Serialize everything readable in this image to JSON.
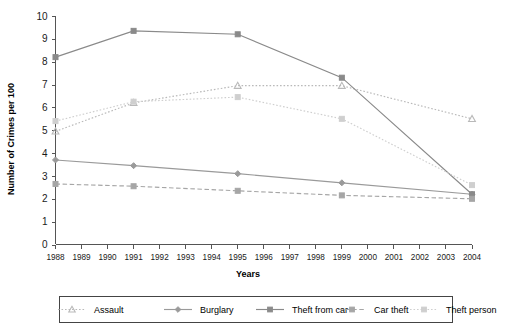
{
  "chart_data": {
    "type": "line",
    "title": "",
    "subtitle": "",
    "xlabel": "Years",
    "ylabel": "Number of Crimes per 100",
    "x": [
      1988,
      1991,
      1995,
      1999,
      2004
    ],
    "xlim": [
      1988,
      2004
    ],
    "ylim": [
      0,
      10
    ],
    "yticks": [
      0,
      1,
      2,
      3,
      4,
      5,
      6,
      7,
      8,
      9,
      10
    ],
    "ytick_labels": [
      "0",
      "1",
      "2",
      "3",
      "4",
      "5",
      "6",
      "7",
      "8",
      "9",
      "10"
    ],
    "xticks": [
      1988,
      1989,
      1990,
      1991,
      1992,
      1993,
      1994,
      1995,
      1996,
      1997,
      1998,
      1999,
      2000,
      2001,
      2002,
      2003,
      2004
    ],
    "xtick_labels": [
      "1988",
      "1989",
      "1990",
      "1991",
      "1992",
      "1993",
      "1994",
      "1995",
      "1996",
      "1997",
      "1998",
      "1999",
      "2000",
      "2001",
      "2002",
      "2003",
      "2004"
    ],
    "grid": false,
    "legend_position": "below",
    "series": [
      {
        "name": "Assault",
        "values": [
          4.95,
          6.2,
          6.95,
          6.95,
          5.5
        ],
        "marker": "triangle",
        "linestyle": "dotted",
        "color": "#b9b9b9"
      },
      {
        "name": "Burglary",
        "values": [
          3.7,
          3.45,
          3.1,
          2.7,
          2.2
        ],
        "marker": "diamond",
        "linestyle": "solid",
        "color": "#9a9a9a"
      },
      {
        "name": "Theft from car",
        "values": [
          8.2,
          9.35,
          9.2,
          7.3,
          2.2
        ],
        "marker": "square",
        "linestyle": "solid",
        "color": "#8a8a8a"
      },
      {
        "name": "Car theft",
        "values": [
          2.65,
          2.55,
          2.35,
          2.15,
          2.0
        ],
        "marker": "square",
        "linestyle": "dashed",
        "color": "#a6a6a6"
      },
      {
        "name": "Theft person",
        "values": [
          5.4,
          6.25,
          6.45,
          5.5,
          2.6
        ],
        "marker": "square",
        "linestyle": "dotted",
        "color": "#cfcfcf"
      }
    ]
  },
  "legend": {
    "entries": [
      {
        "label": "Assault"
      },
      {
        "label": "Burglary"
      },
      {
        "label": "Theft from car"
      },
      {
        "label": "Car theft"
      },
      {
        "label": "Theft person"
      }
    ]
  },
  "colors": {
    "background": "#ffffff",
    "axis": "#555555",
    "text": "#000000",
    "legend_border": "#444444"
  }
}
